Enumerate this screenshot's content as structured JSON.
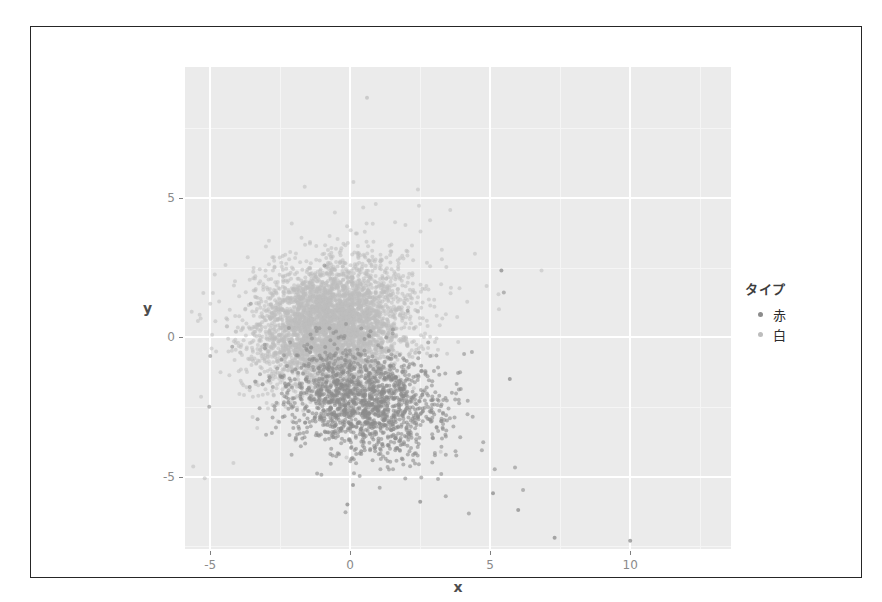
{
  "chart_data": {
    "type": "scatter",
    "title": "",
    "xlabel": "x",
    "ylabel": "y",
    "xlim": [
      -5.9,
      13.6
    ],
    "ylim": [
      -7.6,
      9.7
    ],
    "xticks": [
      -5,
      0,
      5,
      10
    ],
    "yticks": [
      5,
      0,
      -5
    ],
    "xticklabels": [
      "-5",
      "0",
      "5",
      "10"
    ],
    "yticklabels": [
      "5",
      "0",
      "-5"
    ],
    "grid": true,
    "panel_background": "#ebebeb",
    "grid_color": "#ffffff",
    "legend": {
      "title": "タイプ",
      "position": "right",
      "entries": [
        {
          "label": "赤",
          "color": "#8c8c8c"
        },
        {
          "label": "白",
          "color": "#bdbdbd"
        }
      ]
    },
    "series": [
      {
        "name": "白",
        "color": "#bdbdbd",
        "point_size": 3.0,
        "opacity": 0.55,
        "n": 4350,
        "center": [
          -0.7,
          0.45
        ],
        "sd": [
          1.35,
          1.1
        ],
        "correlation": 0.15
      },
      {
        "name": "赤",
        "color": "#8c8c8c",
        "point_size": 3.0,
        "opacity": 0.6,
        "n": 1500,
        "center": [
          0.5,
          -2.3
        ],
        "sd": [
          1.35,
          0.95
        ],
        "correlation": -0.2
      }
    ],
    "outliers": [
      {
        "x": 0.6,
        "y": 8.6,
        "series": "白"
      },
      {
        "x": 13.8,
        "y": 1.4,
        "series": "白"
      },
      {
        "x": 5.4,
        "y": 2.4,
        "series": "赤"
      },
      {
        "x": 5.7,
        "y": -1.5,
        "series": "赤"
      },
      {
        "x": 7.3,
        "y": -7.2,
        "series": "赤"
      },
      {
        "x": 10.0,
        "y": -7.3,
        "series": "赤"
      },
      {
        "x": 6.0,
        "y": -6.2,
        "series": "赤"
      },
      {
        "x": 5.1,
        "y": -5.6,
        "series": "赤"
      },
      {
        "x": 2.5,
        "y": -5.9,
        "series": "赤"
      },
      {
        "x": 0.1,
        "y": -5.3,
        "series": "赤"
      },
      {
        "x": -0.1,
        "y": -6.0,
        "series": "赤"
      }
    ]
  }
}
